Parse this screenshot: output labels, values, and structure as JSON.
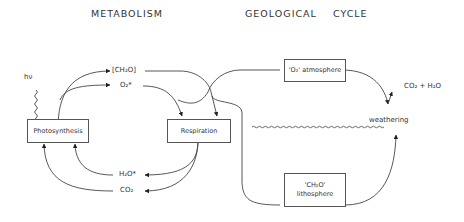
{
  "titles": {
    "metabolism": "METABOLISM",
    "geological_cycle": "GEOLOGICAL    CYCLE"
  },
  "boxes": {
    "photosynthesis": "Photosynthesis",
    "respiration": "Respiration",
    "atmosphere": "'O₂' atmosphere",
    "lithosphere_line1": "'CH₂O'",
    "lithosphere_line2": "lithosphere"
  },
  "labels": {
    "light": "hν",
    "ch2o": "[CH₂O]",
    "o2": "O₂*",
    "h2o": "H₂O*",
    "co2": "CO₂",
    "co2_h2o": "CO₂ + H₂O",
    "weathering": "weathering"
  },
  "colors": {
    "line": "#333333",
    "text": "#333333",
    "background": "#ffffff"
  }
}
